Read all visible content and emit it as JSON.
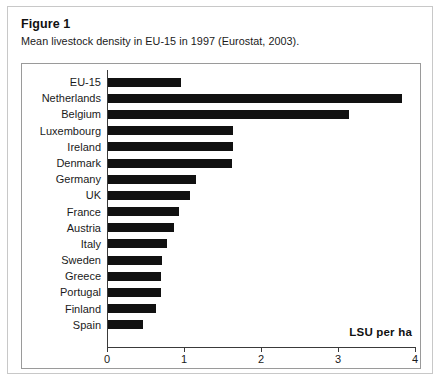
{
  "figure": {
    "label": "Figure 1",
    "caption": "Mean livestock density in EU-15 in 1997 (Eurostat, 2003)."
  },
  "chart_data": {
    "type": "bar",
    "orientation": "horizontal",
    "title": "Mean livestock density in EU-15 in 1997 (Eurostat, 2003).",
    "xlabel": "LSU per ha",
    "ylabel": "",
    "xlim": [
      0,
      4
    ],
    "xticks": [
      0,
      1,
      2,
      3,
      4
    ],
    "xtick_labels": [
      "0",
      "1",
      "2",
      "3",
      "4"
    ],
    "grid": false,
    "legend": false,
    "bar_color": "#111111",
    "categories": [
      "EU-15",
      "Netherlands",
      "Belgium",
      "Luxembourg",
      "Ireland",
      "Denmark",
      "Germany",
      "UK",
      "France",
      "Austria",
      "Italy",
      "Sweden",
      "Greece",
      "Portugal",
      "Finland",
      "Spain"
    ],
    "values": [
      0.96,
      3.83,
      3.14,
      1.64,
      1.63,
      1.62,
      1.16,
      1.08,
      0.94,
      0.87,
      0.78,
      0.71,
      0.7,
      0.7,
      0.64,
      0.47
    ]
  }
}
